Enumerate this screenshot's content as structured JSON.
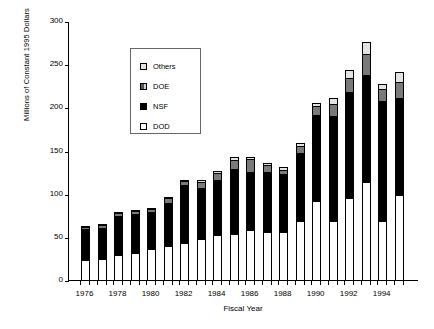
{
  "chart_data": {
    "type": "bar",
    "stacked": true,
    "title": "",
    "xlabel": "Fiscal Year",
    "ylabel": "Millions of Constant 1995 Dollars",
    "ylim": [
      0,
      300
    ],
    "yticks": [
      0,
      50,
      100,
      150,
      200,
      250,
      300
    ],
    "grid": false,
    "legend_position": "upper-left",
    "categories": [
      "1976",
      "1977",
      "1978",
      "1979",
      "1980",
      "1981",
      "1982",
      "1983",
      "1984",
      "1985",
      "1986",
      "1987",
      "1988",
      "1989",
      "1990",
      "1991",
      "1992",
      "1993",
      "1994",
      "1995"
    ],
    "tick_labels": [
      "1976",
      "1978",
      "1980",
      "1982",
      "1984",
      "1986",
      "1988",
      "1990",
      "1992",
      "1994"
    ],
    "series": [
      {
        "name": "DOD",
        "values": [
          24,
          25,
          30,
          32,
          37,
          40,
          44,
          49,
          53,
          55,
          59,
          57,
          57,
          70,
          93,
          70,
          96,
          115,
          70,
          100
        ]
      },
      {
        "name": "NSF",
        "values": [
          37,
          38,
          46,
          47,
          44,
          52,
          68,
          60,
          65,
          76,
          69,
          70,
          68,
          80,
          100,
          122,
          124,
          125,
          140,
          113
        ]
      },
      {
        "name": "DOE",
        "values": [
          4,
          4,
          5,
          5,
          5,
          6,
          6,
          8,
          9,
          11,
          16,
          10,
          6,
          9,
          12,
          15,
          17,
          25,
          15,
          20
        ]
      },
      {
        "name": "Others",
        "values": [
          1,
          1,
          1,
          1,
          1,
          2,
          3,
          3,
          4,
          5,
          3,
          3,
          4,
          4,
          5,
          8,
          11,
          15,
          7,
          13
        ]
      }
    ],
    "totals": [
      66,
      68,
      82,
      85,
      87,
      100,
      121,
      120,
      131,
      147,
      147,
      140,
      135,
      163,
      210,
      215,
      248,
      280,
      232,
      246
    ]
  },
  "legend": {
    "items": [
      {
        "label": "Others",
        "key": "others-swatch",
        "color": "#e3e3e3"
      },
      {
        "label": "DOE",
        "key": "doe-swatch",
        "color": "#7a7a7a"
      },
      {
        "label": "NSF",
        "key": "nsf-swatch",
        "color": "#000000"
      },
      {
        "label": "DOD",
        "key": "dod-swatch",
        "color": "#ffffff"
      }
    ]
  }
}
